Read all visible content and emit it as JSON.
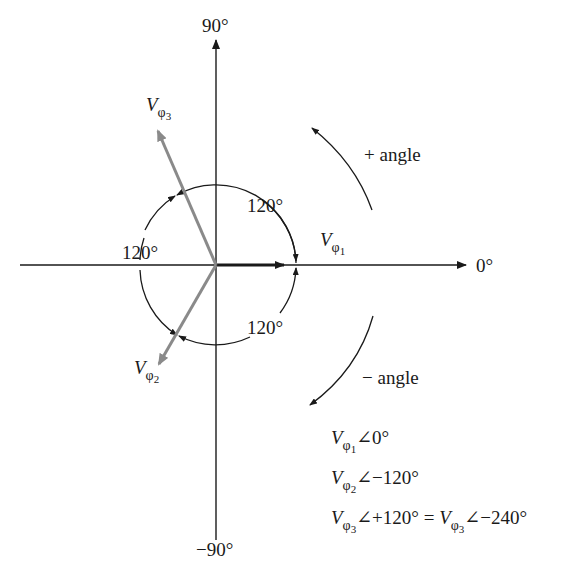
{
  "diagram": {
    "axes": {
      "top_label": "90°",
      "bottom_label": "−90°",
      "right_label": "0°"
    },
    "phasors": [
      {
        "name": "V",
        "sub": "φ",
        "subsub": "1",
        "angle_deg": 0,
        "color": "#1a1a1a"
      },
      {
        "name": "V",
        "sub": "φ",
        "subsub": "2",
        "angle_deg": -120,
        "color": "#8a8a8a"
      },
      {
        "name": "V",
        "sub": "φ",
        "subsub": "3",
        "angle_deg": 120,
        "color": "#8a8a8a"
      }
    ],
    "arc_labels": {
      "upper_right": "120°",
      "left": "120°",
      "lower_right": "120°"
    },
    "direction_labels": {
      "positive": "+ angle",
      "negative": "− angle"
    },
    "equations": [
      {
        "parts": [
          {
            "v": "V",
            "sub": "φ",
            "subsub": "1"
          },
          {
            "text": "∠0°"
          }
        ]
      },
      {
        "parts": [
          {
            "v": "V",
            "sub": "φ",
            "subsub": "2"
          },
          {
            "text": "∠−120°"
          }
        ]
      },
      {
        "parts": [
          {
            "v": "V",
            "sub": "φ",
            "subsub": "3"
          },
          {
            "text": "∠+120° = "
          },
          {
            "v": "V",
            "sub": "φ",
            "subsub": "3"
          },
          {
            "text": "∠−240°"
          }
        ]
      }
    ],
    "colors": {
      "ink": "#1a1a1a",
      "phasor_gray": "#8a8a8a"
    }
  }
}
